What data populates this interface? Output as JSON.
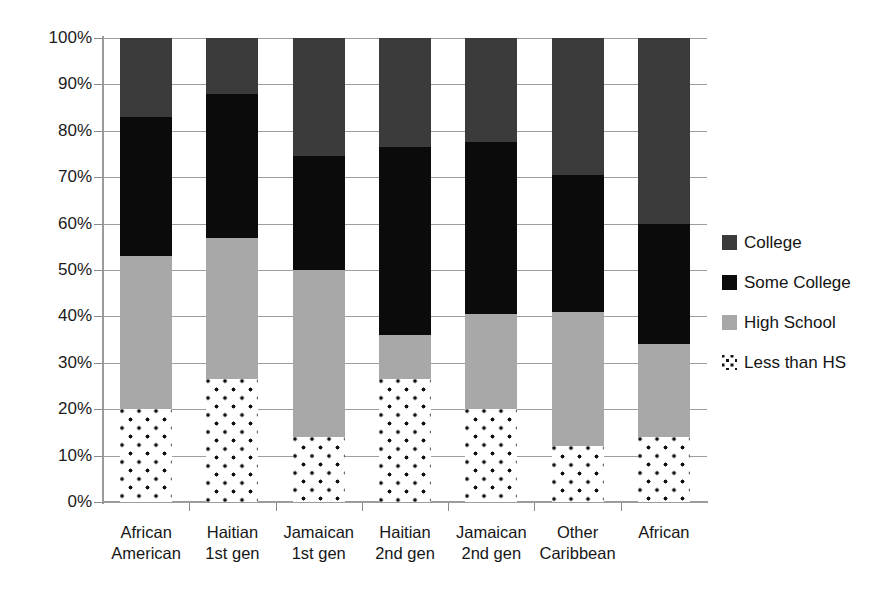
{
  "chart_data": {
    "type": "bar",
    "subtype": "stacked-percent",
    "title": "",
    "xlabel": "",
    "ylabel": "",
    "ylim": [
      0,
      100
    ],
    "ytick_labels": [
      "100%",
      "90%",
      "80%",
      "70%",
      "60%",
      "50%",
      "40%",
      "30%",
      "20%",
      "10%",
      "0%"
    ],
    "ytick_values": [
      100,
      90,
      80,
      70,
      60,
      50,
      40,
      30,
      20,
      10,
      0
    ],
    "grid": true,
    "legend_position": "right",
    "stack_order_bottom_to_top": [
      "Less than HS",
      "High School",
      "Some College",
      "College"
    ],
    "categories": [
      {
        "line1": "African",
        "line2": "American"
      },
      {
        "line1": "Haitian",
        "line2": "1st gen"
      },
      {
        "line1": "Jamaican",
        "line2": "1st gen"
      },
      {
        "line1": "Haitian",
        "line2": "2nd gen"
      },
      {
        "line1": "Jamaican",
        "line2": "2nd gen"
      },
      {
        "line1": "Other",
        "line2": "Caribbean"
      },
      {
        "line1": "African",
        "line2": ""
      }
    ],
    "series": [
      {
        "name": "Less than HS",
        "color": "#ffffff",
        "pattern": "dots",
        "values": [
          20,
          26.5,
          14,
          26.5,
          20,
          12,
          14
        ]
      },
      {
        "name": "High School",
        "color": "#a8a8a8",
        "values": [
          33,
          30.5,
          36,
          9.5,
          20.5,
          29,
          20
        ]
      },
      {
        "name": "Some College",
        "color": "#0b0b0b",
        "values": [
          30,
          31,
          24.5,
          40.5,
          37,
          29.5,
          26
        ]
      },
      {
        "name": "College",
        "color": "#3b3b3b",
        "values": [
          17,
          12,
          25.5,
          23.5,
          22.5,
          29.5,
          40
        ]
      }
    ],
    "cumulative_tops": [
      [
        20,
        53,
        83,
        100
      ],
      [
        26.5,
        57,
        88,
        100
      ],
      [
        14,
        50,
        74.5,
        100
      ],
      [
        26.5,
        36,
        76.5,
        100
      ],
      [
        20,
        40.5,
        77.5,
        100
      ],
      [
        12,
        41,
        70.5,
        100
      ],
      [
        14,
        34,
        60,
        100
      ]
    ]
  },
  "legend": {
    "items": [
      {
        "label": "College",
        "swatch": "college"
      },
      {
        "label": "Some College",
        "swatch": "some"
      },
      {
        "label": "High School",
        "swatch": "hs"
      },
      {
        "label": "Less than HS",
        "swatch": "less"
      }
    ]
  },
  "colors": {
    "college": "#3b3b3b",
    "some_college": "#0b0b0b",
    "high_school": "#a8a8a8",
    "less_than_hs_dots": "#111111",
    "gridline": "#9d9d9d",
    "axis": "#9a9a9a",
    "text": "#1a1a1a",
    "background": "#ffffff"
  }
}
